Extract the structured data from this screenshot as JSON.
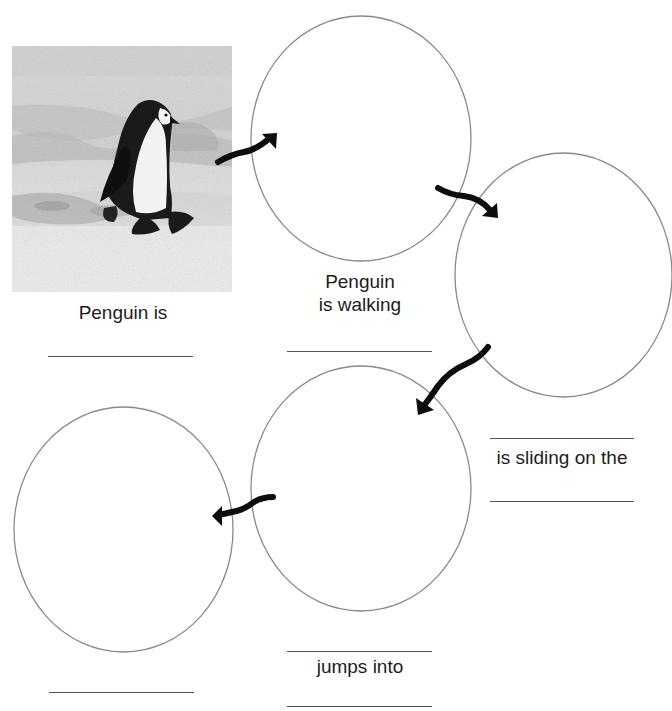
{
  "worksheet": {
    "header_cutoff_text": "",
    "photo": {
      "description": "Illustration of a penguin walking on snow and ice",
      "icon": "penguin-photo"
    },
    "stages": [
      {
        "id": "stage-1",
        "type": "photo",
        "label": "Penguin is",
        "blank_count": 1
      },
      {
        "id": "stage-2",
        "type": "circle",
        "label_line1": "Penguin",
        "label_line2": "is walking",
        "blank_count": 1
      },
      {
        "id": "stage-3",
        "type": "circle",
        "label": "is sliding on the",
        "blank_count": 2
      },
      {
        "id": "stage-4",
        "type": "circle",
        "label": "jumps into",
        "blank_count": 2
      },
      {
        "id": "stage-5",
        "type": "circle",
        "label": "",
        "blank_count": 1
      }
    ],
    "arrows": [
      {
        "from": "stage-1",
        "to": "stage-2",
        "icon": "curved-arrow-right"
      },
      {
        "from": "stage-2",
        "to": "stage-3",
        "icon": "curved-arrow-down-right"
      },
      {
        "from": "stage-3",
        "to": "stage-4",
        "icon": "curved-arrow-down-left"
      },
      {
        "from": "stage-4",
        "to": "stage-5",
        "icon": "curved-arrow-left"
      }
    ],
    "colors": {
      "circle_stroke": "#8a8a8a",
      "arrow": "#0d0d0d",
      "text": "#1c1c1c",
      "blank_line": "#555555"
    }
  }
}
